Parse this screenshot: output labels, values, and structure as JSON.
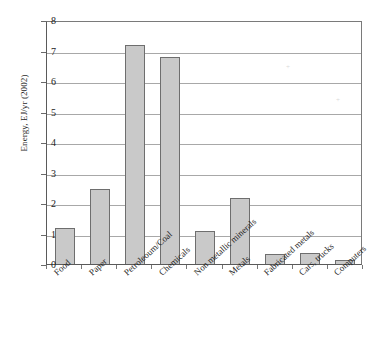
{
  "chart_data": {
    "type": "bar",
    "title": "",
    "subtitle": "",
    "xlabel": "",
    "ylabel": "Energy, EJ/yr (2002)",
    "ylim": [
      0,
      8
    ],
    "yticks": [
      0,
      1,
      2,
      3,
      4,
      5,
      6,
      7,
      8
    ],
    "ytick_labels": [
      "0",
      "1",
      "2",
      "3",
      "4",
      "5",
      "6",
      "7",
      "8"
    ],
    "grid": "horizontal",
    "legend": "none",
    "bar_color": "#c9c9c9",
    "bar_edge_color": "#6e6e6e",
    "axis_color": "#5a5a5a",
    "gridline_color": "#a8a8a8",
    "categories": [
      "Food",
      "Paper",
      "Petroleoum/Coal",
      "Chemicals",
      "Non metallic minerals",
      "Metals",
      "Fabricated metals",
      "Cars, trucks",
      "Computers"
    ],
    "values": [
      1.17,
      2.47,
      7.17,
      6.8,
      1.07,
      2.17,
      0.34,
      0.36,
      0.12
    ]
  }
}
